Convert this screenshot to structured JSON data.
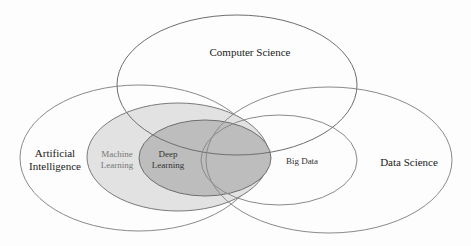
{
  "diagram": {
    "type": "venn",
    "colors": {
      "stroke": "#8a8a8a",
      "machine_learning_fill": "#e2e2e2",
      "deep_learning_fill": "#bdbdbd",
      "text": "#1a1a1a"
    },
    "sets": [
      {
        "id": "computer-science",
        "label": "Computer Science"
      },
      {
        "id": "artificial-intelligence",
        "label_line1": "Artificial",
        "label_line2": "Intelligence"
      },
      {
        "id": "machine-learning",
        "label_line1": "Machine",
        "label_line2": "Learning"
      },
      {
        "id": "deep-learning",
        "label_line1": "Deep",
        "label_line2": "Learning"
      },
      {
        "id": "big-data",
        "label": "Big Data"
      },
      {
        "id": "data-science",
        "label": "Data Science"
      }
    ]
  }
}
